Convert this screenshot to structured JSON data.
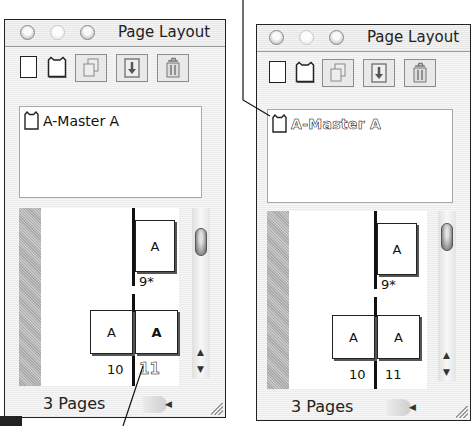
{
  "palettes": [
    {
      "id": "left",
      "title": "Page Layout",
      "toolbar": {
        "icons": [
          "plain-page-icon",
          "master-page-icon",
          "duplicate-page-icon",
          "load-page-icon",
          "trash-icon"
        ]
      },
      "masters": [
        {
          "label": "A-Master A",
          "highlighted": false
        }
      ],
      "pages": {
        "single": {
          "letter": "A",
          "number": "9*"
        },
        "spread_left": {
          "letter": "A",
          "number": "10"
        },
        "spread_right": {
          "letter": "A",
          "number": "11",
          "highlighted": true
        }
      },
      "status": "3 Pages"
    },
    {
      "id": "right",
      "title": "Page Layout",
      "toolbar": {
        "icons": [
          "plain-page-icon",
          "master-page-icon",
          "duplicate-page-icon",
          "load-page-icon",
          "trash-icon"
        ]
      },
      "masters": [
        {
          "label": "A-Master A",
          "highlighted": true
        }
      ],
      "pages": {
        "single": {
          "letter": "A",
          "number": "9*"
        },
        "spread_left": {
          "letter": "A",
          "number": "10"
        },
        "spread_right": {
          "letter": "A",
          "number": "11",
          "highlighted": false
        }
      },
      "status": "3 Pages"
    }
  ],
  "colors": {
    "outline": "#222222",
    "panel_bg": "#f2f2f2",
    "pane_bg": "#ffffff",
    "strip": "#b8b8b8"
  }
}
